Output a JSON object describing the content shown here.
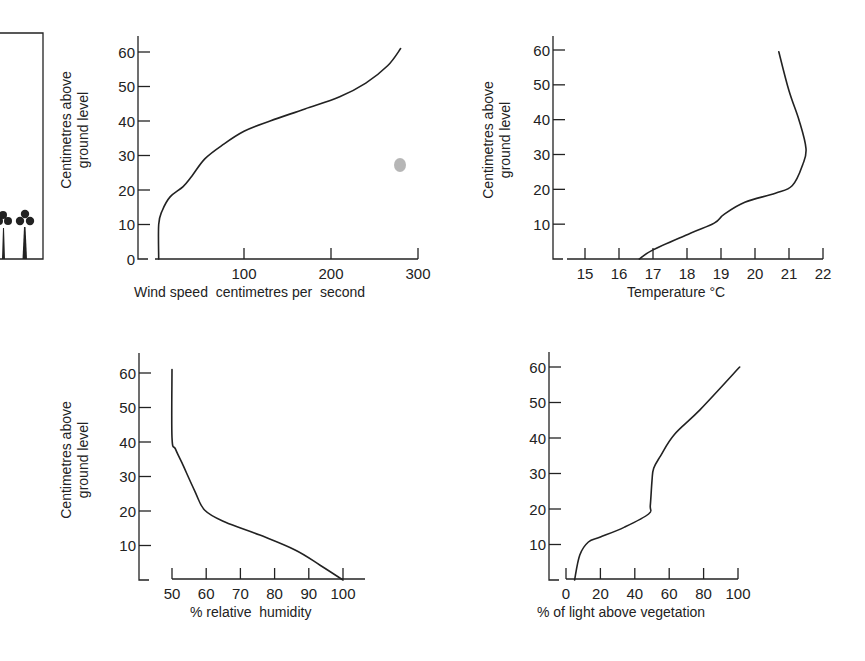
{
  "figure": {
    "illustration": {
      "label": "vegetation-illustration",
      "plants": 2
    },
    "smudge": {
      "color": "#a9a9a9"
    },
    "colors": {
      "ink": "#222222",
      "background": "#ffffff"
    }
  },
  "chart_data": [
    {
      "id": "wind",
      "type": "line",
      "title": "",
      "xlabel": "Wind speed  centimetres per  second",
      "ylabel": [
        "Centimetres above",
        "ground level"
      ],
      "xticks": [
        100,
        200,
        300
      ],
      "yticks": [
        0,
        10,
        20,
        30,
        40,
        50,
        60
      ],
      "xlim": [
        0,
        300
      ],
      "ylim": [
        0,
        60
      ],
      "grid": false,
      "series": [
        {
          "name": "wind speed profile",
          "x": [
            2,
            2,
            6,
            15,
            30,
            40,
            55,
            75,
            100,
            130,
            170,
            210,
            240,
            265,
            280
          ],
          "y": [
            0,
            10,
            14,
            18,
            21,
            24,
            29,
            33,
            37,
            40,
            43.5,
            47,
            51,
            56,
            61
          ]
        }
      ]
    },
    {
      "id": "temperature",
      "type": "line",
      "title": "",
      "xlabel": "Temperature °C",
      "ylabel": [
        "Centimetres above",
        "ground level"
      ],
      "xticks": [
        15,
        16,
        17,
        18,
        19,
        20,
        21,
        22
      ],
      "yticks": [
        10,
        20,
        30,
        40,
        50,
        60
      ],
      "xlim": [
        14.5,
        22
      ],
      "ylim": [
        0,
        60
      ],
      "grid": false,
      "series": [
        {
          "name": "temperature profile",
          "x": [
            16.6,
            17.0,
            18.1,
            18.8,
            19.1,
            19.7,
            20.6,
            21.1,
            21.4,
            21.5,
            21.3,
            21.0,
            20.7
          ],
          "y": [
            0,
            2.6,
            7.4,
            10.3,
            12.9,
            16.3,
            18.9,
            21.1,
            27,
            31.7,
            39.7,
            48.3,
            59.5
          ]
        }
      ]
    },
    {
      "id": "humidity",
      "type": "line",
      "title": "",
      "xlabel": "% relative  humidity",
      "ylabel": [
        "Centimetres above",
        "ground level"
      ],
      "xticks": [
        50,
        60,
        70,
        80,
        90,
        100
      ],
      "yticks": [
        10,
        20,
        30,
        40,
        50,
        60
      ],
      "xlim": [
        50,
        105
      ],
      "ylim": [
        0,
        60
      ],
      "grid": false,
      "series": [
        {
          "name": "relative humidity profile",
          "x": [
            50,
            50,
            51,
            52.9,
            56.7,
            59.6,
            65.5,
            75.7,
            86,
            93.3,
            100
          ],
          "y": [
            61,
            41.3,
            38,
            34,
            25.7,
            20.2,
            16.8,
            13,
            8.7,
            4.3,
            0
          ]
        }
      ]
    },
    {
      "id": "light",
      "type": "line",
      "title": "",
      "xlabel": "% of light above vegetation",
      "ylabel": [],
      "xticks": [
        0,
        20,
        40,
        60,
        80,
        100
      ],
      "yticks": [
        10,
        20,
        30,
        40,
        50,
        60
      ],
      "xlim": [
        0,
        100
      ],
      "ylim": [
        0,
        60
      ],
      "grid": false,
      "series": [
        {
          "name": "light penetration profile",
          "x": [
            5,
            8,
            13,
            20,
            34,
            48,
            49,
            50,
            51,
            55,
            63,
            78,
            101
          ],
          "y": [
            0,
            7,
            10.7,
            12.1,
            14.9,
            18.6,
            21,
            28,
            31.5,
            35,
            41,
            48,
            60
          ]
        }
      ]
    }
  ]
}
